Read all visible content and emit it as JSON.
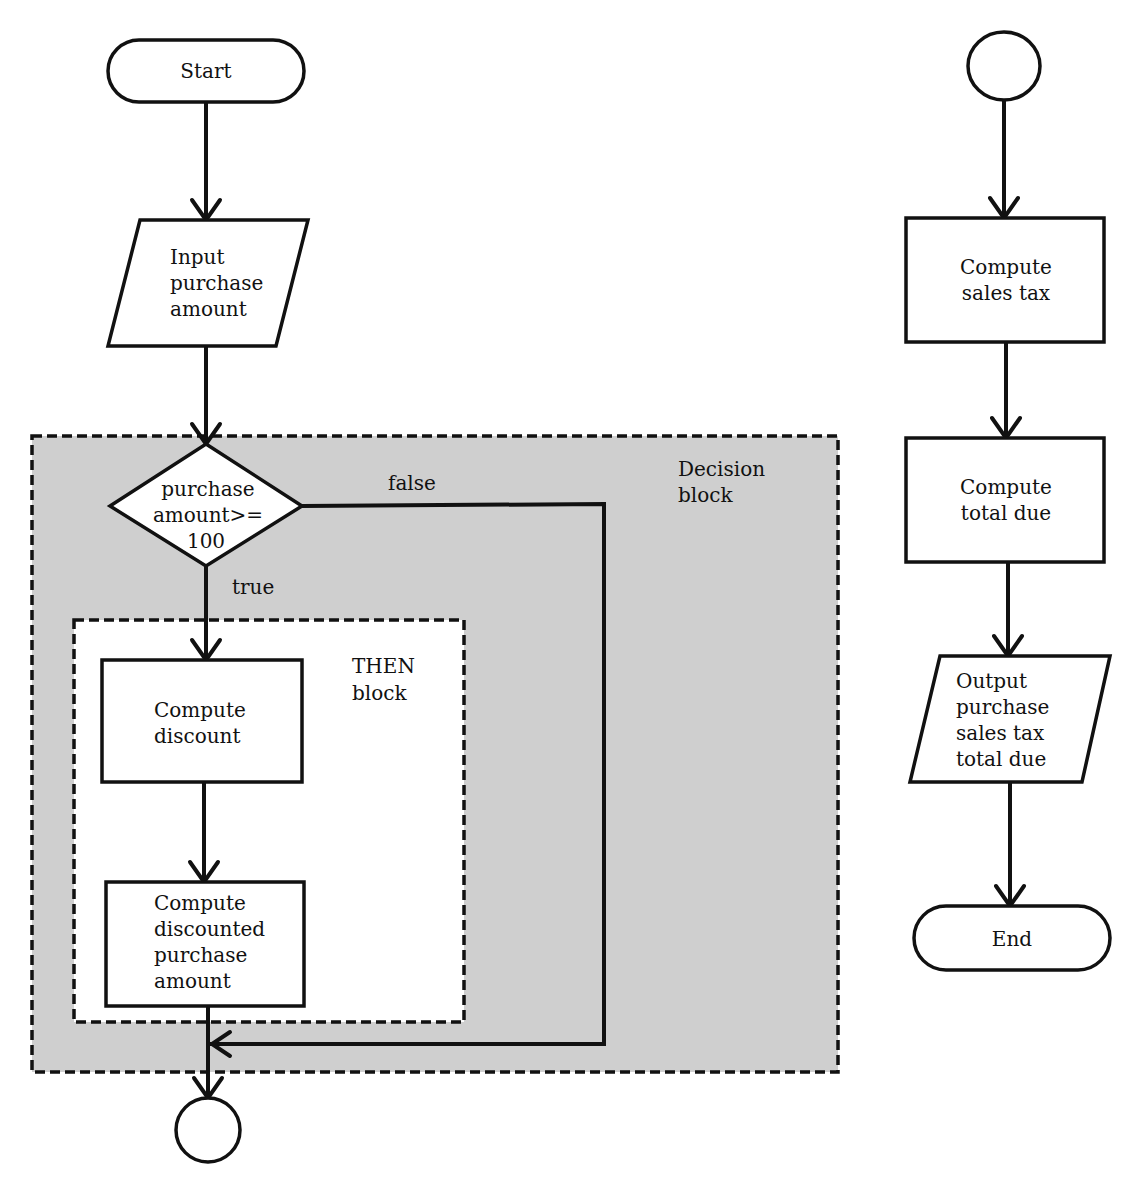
{
  "diagram": {
    "title": "",
    "colors": {
      "decision_block_fill": "#cfcfcf",
      "stroke": "#111111",
      "background": "#ffffff"
    },
    "nodes": {
      "start": {
        "type": "terminator",
        "label": "Start"
      },
      "input": {
        "type": "io",
        "lines": [
          "Input",
          "purchase",
          "amount"
        ]
      },
      "decision": {
        "type": "decision",
        "lines": [
          "purchase",
          "amount>=",
          "100"
        ]
      },
      "compute_discount": {
        "type": "process",
        "lines": [
          "Compute",
          "discount"
        ]
      },
      "compute_discounted": {
        "type": "process",
        "lines": [
          "Compute",
          "discounted",
          "purchase",
          "amount"
        ]
      },
      "connector_out": {
        "type": "connector",
        "label": ""
      },
      "connector_in": {
        "type": "connector",
        "label": ""
      },
      "compute_tax": {
        "type": "process",
        "lines": [
          "Compute",
          "sales tax"
        ]
      },
      "compute_total": {
        "type": "process",
        "lines": [
          "Compute",
          "total due"
        ]
      },
      "output": {
        "type": "io",
        "lines": [
          "Output",
          "purchase",
          "sales tax",
          "total due"
        ]
      },
      "end": {
        "type": "terminator",
        "label": "End"
      }
    },
    "edge_labels": {
      "false": "false",
      "true": "true"
    },
    "regions": {
      "decision_block": {
        "lines": [
          "Decision",
          "block"
        ]
      },
      "then_block": {
        "lines": [
          "THEN",
          "block"
        ]
      }
    }
  }
}
